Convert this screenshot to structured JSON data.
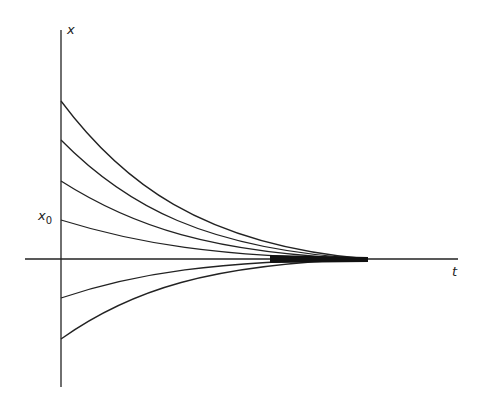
{
  "diagram": {
    "axes": {
      "y_label": "x",
      "x_label": "t",
      "initial_label": "x",
      "initial_subscript": "0"
    },
    "curves": {
      "count": 6,
      "description": "Exponential decay trajectories converging to the t-axis",
      "start_values_px": [
        101,
        140,
        181,
        220,
        298,
        339
      ],
      "convergence_x_px": 368
    },
    "colors": {
      "stroke": "#222222",
      "background": "#ffffff"
    }
  }
}
